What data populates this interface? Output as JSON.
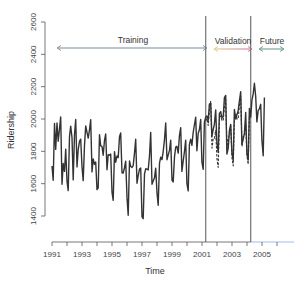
{
  "chart_data": {
    "type": "line",
    "title": "",
    "xlabel": "Time",
    "ylabel": "Ridership",
    "xlim": [
      1991,
      2006.5
    ],
    "ylim": [
      1300,
      2650
    ],
    "x_ticks": [
      1991,
      1992,
      1993,
      1994,
      1995,
      1996,
      1997,
      1998,
      1999,
      2000,
      2001,
      2002,
      2003,
      2004,
      2005,
      2006
    ],
    "x_tick_labels": [
      "1991",
      "1993",
      "1995",
      "1997",
      "1999",
      "2001",
      "2003",
      "2005"
    ],
    "x_tick_label_values": [
      1991,
      1993,
      1995,
      1997,
      1999,
      2001,
      2003,
      2005
    ],
    "y_ticks": [
      1400,
      1600,
      1800,
      2000,
      2200,
      2400,
      2600
    ],
    "y_tick_labels": [
      "1400",
      "1600",
      "1800",
      "2000",
      "2200",
      "2400",
      "2600"
    ],
    "grid": false,
    "legend": null,
    "partitions": [
      {
        "name": "Training",
        "start": 1991.0,
        "end": 2001.25
      },
      {
        "name": "Validation",
        "start": 2001.25,
        "end": 2004.25
      },
      {
        "name": "Future",
        "start": 2004.25,
        "end": 2006.0
      }
    ],
    "vertical_lines": [
      2001.25,
      2004.25
    ],
    "series": [
      {
        "name": "Actual ridership",
        "style": "solid",
        "start": 1991.0,
        "step": 0.0833,
        "values": [
          1709,
          1621,
          1973,
          1812,
          1975,
          1862,
          1940,
          2013,
          1596,
          1725,
          1676,
          1814,
          1615,
          1557,
          1891,
          1956,
          1885,
          1623,
          1903,
          1997,
          1704,
          1810,
          1862,
          1875,
          1705,
          1619,
          1837,
          1957,
          1917,
          1882,
          1933,
          1996,
          1673,
          1753,
          1720,
          1734,
          1563,
          1574,
          1903,
          1834,
          1831,
          1776,
          1868,
          1907,
          1686,
          1779,
          1776,
          1783,
          1548,
          1497,
          1798,
          1733,
          1772,
          1761,
          1890,
          1914,
          1668,
          1666,
          1699,
          1739,
          1515,
          1405,
          1741,
          1706,
          1700,
          1712,
          1789,
          1875,
          1603,
          1649,
          1690,
          1697,
          1395,
          1383,
          1660,
          1692,
          1690,
          1685,
          1773,
          1917,
          1596,
          1616,
          1636,
          1696,
          1543,
          1466,
          1727,
          1764,
          1749,
          1800,
          1873,
          1975,
          1748,
          1778,
          1806,
          1869,
          1621,
          1611,
          1766,
          1826,
          1831,
          1789,
          1895,
          1947,
          1676,
          1740,
          1796,
          1869,
          1601,
          1555,
          1841,
          1875,
          1837,
          1918,
          1963,
          2011,
          1803,
          1912,
          1933,
          1997,
          1735,
          1689,
          1981,
          2011,
          2019,
          1992,
          2093,
          2098,
          1891,
          1936,
          1967,
          2056,
          1852,
          1794,
          2034,
          2046,
          2007,
          2014,
          2132,
          2146,
          1783,
          1818,
          1928,
          1966,
          1791,
          1744,
          2059,
          2000,
          2026,
          2052,
          2110,
          2169,
          1843,
          1875,
          1910,
          2040,
          1787,
          1746,
          2065,
          2012,
          2117,
          2155,
          2221,
          2139,
          1982,
          2053,
          2063,
          2091,
          1868,
          1773,
          2133
        ]
      },
      {
        "name": "Forecast (validation)",
        "style": "dashed",
        "start": 2001.25,
        "step": 0.0833,
        "values": [
          1990,
          2004,
          1960,
          2050,
          2110,
          1820,
          1880,
          1880,
          1930,
          1750,
          1700,
          2000,
          2020,
          1990,
          1990,
          2080,
          2120,
          1820,
          1880,
          1900,
          1960,
          1760,
          1710,
          2010,
          2030,
          2000,
          2000,
          2090,
          2140,
          1830,
          1890,
          1910,
          1970,
          1770,
          1720,
          2020
        ]
      }
    ]
  },
  "labels": {
    "training": "Training",
    "validation": "Validation",
    "future": "Future",
    "xlabel": "Time",
    "ylabel": "Ridership"
  },
  "colors": {
    "series": "#333333",
    "axis": "#555555",
    "training_arrow": "#6a7f8f",
    "validation_arrow_left": "#d9c070",
    "validation_arrow_right": "#c05a8a",
    "future_arrow": "#4f8a78",
    "future_axis": "#8fa8e0"
  }
}
